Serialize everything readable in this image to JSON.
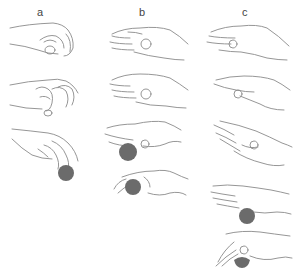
{
  "figure": {
    "columns": [
      {
        "label": "a",
        "panels": [
          {
            "name": "pinch-grip-closed",
            "has_ball": false
          },
          {
            "name": "claw-grip-open",
            "has_ball": false
          },
          {
            "name": "pinch-grip-holding-ball",
            "has_ball": true
          }
        ]
      },
      {
        "label": "b",
        "panels": [
          {
            "name": "flat-hand-thumb-tucked",
            "has_ball": false
          },
          {
            "name": "flat-hand-thumb-tucked-relaxed",
            "has_ball": false
          },
          {
            "name": "flat-hand-ball-underneath",
            "has_ball": true
          },
          {
            "name": "cupped-hand-holding-ball",
            "has_ball": true
          }
        ]
      },
      {
        "label": "c",
        "panels": [
          {
            "name": "flat-hand-fingers-extended",
            "has_ball": false
          },
          {
            "name": "flat-hand-side-view",
            "has_ball": false
          },
          {
            "name": "hand-palm-up-open",
            "has_ball": false
          },
          {
            "name": "flat-hand-ball-underneath",
            "has_ball": true
          },
          {
            "name": "hand-gripping-ball-from-above",
            "has_ball": true
          }
        ]
      }
    ],
    "colors": {
      "line": "#8a8a8a",
      "ball": "#6b6b6b",
      "label": "#444444",
      "background": "#ffffff"
    }
  }
}
